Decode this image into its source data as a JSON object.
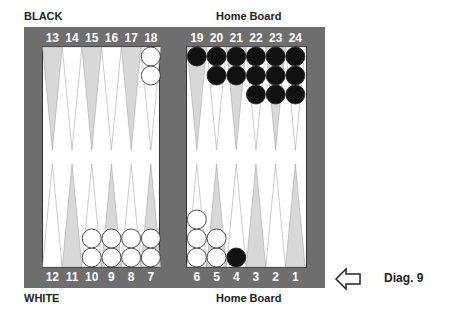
{
  "labels": {
    "top_left": "BLACK",
    "top_right": "Home Board",
    "bottom_left": "WHITE",
    "bottom_right": "Home Board",
    "diagram": "Diag. 9"
  },
  "arrow": {
    "icon": "left-arrow-icon",
    "direction": "left"
  },
  "colors": {
    "frame": "#6e6e6e",
    "point_light": "#d8d8d8",
    "point_white": "#ffffff",
    "black_checker": "#111111",
    "white_checker": "#ffffff"
  },
  "points_top": [
    "13",
    "14",
    "15",
    "16",
    "17",
    "18",
    "19",
    "20",
    "21",
    "22",
    "23",
    "24"
  ],
  "points_bottom": [
    "12",
    "11",
    "10",
    "9",
    "8",
    "7",
    "6",
    "5",
    "4",
    "3",
    "2",
    "1"
  ],
  "position": {
    "black": {
      "19": 1,
      "20": 2,
      "21": 2,
      "22": 3,
      "23": 3,
      "24": 3,
      "4": 1
    },
    "white": {
      "18": 2,
      "10": 2,
      "9": 2,
      "8": 2,
      "7": 2,
      "6": 3,
      "5": 2
    }
  }
}
